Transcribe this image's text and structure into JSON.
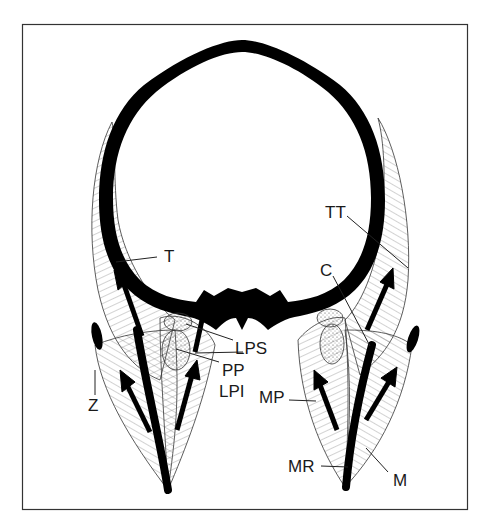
{
  "diagram": {
    "type": "anatomical-cross-section",
    "frame": {
      "x": 22,
      "y": 24,
      "width": 445,
      "height": 486,
      "stroke": "#333333"
    },
    "colors": {
      "bone": "#000000",
      "muscle_fill": "#f4f4f4",
      "hatch": "#555555",
      "stipple_fill": "#ececec",
      "label": "#1a1a1a"
    },
    "labels": {
      "T": "T",
      "TT": "TT",
      "C": "C",
      "LPS": "LPS",
      "PP": "PP",
      "LPI": "LPI",
      "Z": "Z",
      "MP": "MP",
      "MR": "MR",
      "M": "M"
    }
  }
}
